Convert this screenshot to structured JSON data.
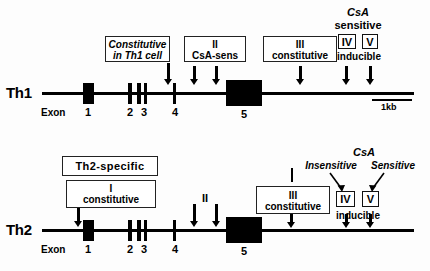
{
  "figure": {
    "type": "gene-structure-diagram",
    "scale_bar": {
      "label": "1kb"
    },
    "exon_word": "Exon"
  },
  "panels": [
    {
      "id": "th1",
      "row_label": "Th1",
      "exons": [
        "1",
        "2",
        "3",
        "4",
        "5"
      ],
      "annotations": [
        {
          "name": "region-I-box",
          "lines": [
            "Constitutive",
            "in Th1 cell"
          ],
          "italic_first": true
        },
        {
          "name": "region-II-box",
          "lines": [
            "II",
            "CsA-sens"
          ]
        },
        {
          "name": "region-III-box",
          "lines": [
            "III",
            "constitutive"
          ]
        },
        {
          "name": "region-IV-tag",
          "label": "IV"
        },
        {
          "name": "region-V-tag",
          "label": "V"
        }
      ],
      "csa_header": {
        "line1": "CsA",
        "line2": "sensitive"
      },
      "inducible_label": "inducible",
      "scale_label": "1kb"
    },
    {
      "id": "th2",
      "row_label": "Th2",
      "exons": [
        "1",
        "2",
        "3",
        "4",
        "5"
      ],
      "annotations": [
        {
          "name": "th2-specific-box",
          "lines": [
            "Th2-specific"
          ]
        },
        {
          "name": "region-I-box",
          "lines": [
            "I",
            "constitutive"
          ]
        },
        {
          "name": "region-II-label",
          "label": "II"
        },
        {
          "name": "region-III-box",
          "lines": [
            "III",
            "constitutive"
          ]
        },
        {
          "name": "region-IV-tag",
          "label": "IV"
        },
        {
          "name": "region-V-tag",
          "label": "V"
        }
      ],
      "csa_header": {
        "line1": "CsA"
      },
      "csa_insensitive": "Insensitive",
      "csa_sensitive": "Sensitive",
      "inducible_label": "inducible"
    }
  ],
  "th1": {
    "row_label": "Th1",
    "exon_word": "Exon",
    "exon_1": "1",
    "exon_2": "2",
    "exon_3": "3",
    "exon_4": "4",
    "exon_5": "5",
    "box1_line1": "Constitutive",
    "box1_line2": "in Th1 cell",
    "box2_line1": "II",
    "box2_line2": "CsA-sens",
    "box3_line1": "III",
    "box3_line2": "constitutive",
    "csa": "CsA",
    "sensitive": "sensitive",
    "iv": "IV",
    "v": "V",
    "inducible": "inducible",
    "scale": "1kb"
  },
  "th2": {
    "row_label": "Th2",
    "exon_word": "Exon",
    "exon_1": "1",
    "exon_2": "2",
    "exon_3": "3",
    "exon_4": "4",
    "exon_5": "5",
    "specific_box": "Th2-specific",
    "box1_line1": "I",
    "box1_line2": "constitutive",
    "label_II": "II",
    "box3_line1": "III",
    "box3_line2": "constitutive",
    "csa": "CsA",
    "insensitive": "Insensitive",
    "sensitive": "Sensitive",
    "iv": "IV",
    "v": "V",
    "inducible": "inducible"
  },
  "colors": {
    "ink": "#000000",
    "background": "#fdfdfd",
    "box_border": "#222222"
  }
}
